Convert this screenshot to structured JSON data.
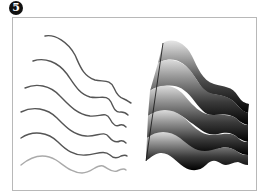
{
  "step": {
    "label": "5",
    "badge_color": "#111111"
  },
  "figure": {
    "frame_color": "#b8b8b8",
    "left_panel": {
      "description": "six source stroke curves",
      "stroke_dark": "#555555",
      "stroke_light": "#aaaaaa",
      "curves": 6
    },
    "right_panel": {
      "description": "blended wave bands with black-to-light gradient",
      "bands": 5,
      "gradient_dark": "#000000",
      "gradient_light": "#d8d8d8"
    }
  }
}
